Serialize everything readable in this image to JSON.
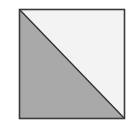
{
  "diagram": {
    "shape": "square",
    "divided_by": "diagonal from top-left to bottom-right",
    "regions": [
      {
        "name": "lower-left triangle",
        "fill": "#a9a9a9"
      },
      {
        "name": "upper-right triangle",
        "fill": "#f3f3f3"
      }
    ],
    "stroke_color": "#3a3a3a"
  }
}
